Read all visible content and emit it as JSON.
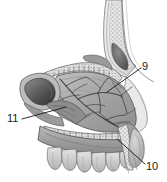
{
  "figure": {
    "type": "anatomical-illustration",
    "style": "grayscale medical line and tone drawing",
    "background_color": "#ffffff",
    "ink_color": "#1a1a1a",
    "tone_colors": {
      "mucosa_mid": "#a8a8a8",
      "mucosa_light": "#c9c9c9",
      "mucosa_dark": "#6e6e6e",
      "cavity_shadow": "#4a4a4a",
      "bone_light": "#dcdcdc",
      "vessel_line": "#3a3a3a"
    }
  },
  "labels": [
    {
      "id": "9",
      "text": "9",
      "position": "upper-right",
      "leader_from": [
        141,
        68
      ],
      "leader_to": [
        107,
        92
      ]
    },
    {
      "id": "10",
      "text": "10",
      "position": "lower-right",
      "leader_from": [
        145,
        164
      ],
      "leader_to": [
        117,
        139
      ]
    },
    {
      "id": "11",
      "text": "11",
      "position": "mid-left",
      "leader_from": [
        22,
        119
      ],
      "leader_to": [
        66,
        107
      ]
    }
  ]
}
